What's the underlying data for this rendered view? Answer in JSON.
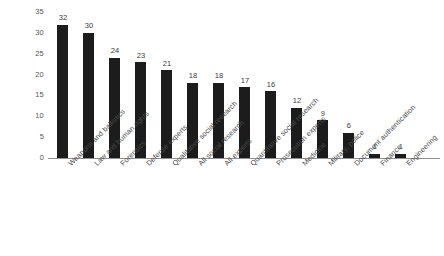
{
  "chart_data": {
    "type": "bar",
    "title": "",
    "subtitle": "",
    "xlabel": "",
    "ylabel": "",
    "ylim": [
      0,
      35
    ],
    "yticks": [
      0,
      5,
      10,
      15,
      20,
      25,
      30,
      35
    ],
    "grid": false,
    "legend": false,
    "bar_color": "#1c1c1c",
    "background_color": "#ffffff",
    "value_labels_shown": true,
    "xtick_rotation": -45,
    "categories": [
      "Weapons and ballistics",
      "Law and human rights",
      "Forensics",
      "Defense experts",
      "Qualitative social research",
      "All social research",
      "All experts",
      "Quantitative social research",
      "Prosecution experts",
      "Medicine",
      "Military, police",
      "Document authentication",
      "Finance",
      "Engineering"
    ],
    "values": [
      32,
      30,
      24,
      23,
      21,
      18,
      18,
      17,
      16,
      12,
      9,
      6,
      1,
      1
    ]
  }
}
